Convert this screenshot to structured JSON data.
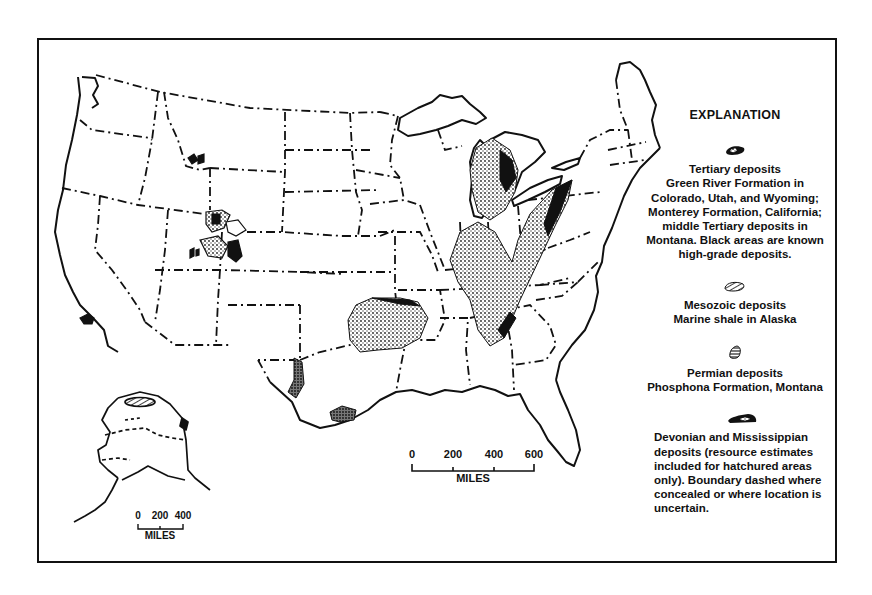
{
  "figure": {
    "type": "map"
  },
  "legend": {
    "title": "EXPLANATION",
    "items": [
      {
        "symbol": "tertiary-deposit-symbol",
        "name": "Tertiary deposits",
        "description": "Green River Formation in Colorado, Utah, and Wyoming; Monterey Formation, California; middle Tertiary deposits in Montana. Black areas are known high-grade deposits."
      },
      {
        "symbol": "mesozoic-deposit-symbol",
        "name": "Mesozoic deposits",
        "description": "Marine shale in Alaska"
      },
      {
        "symbol": "permian-deposit-symbol",
        "name": "Permian deposits",
        "description": "Phosphona Formation, Montana"
      },
      {
        "symbol": "devonian-mississippian-deposit-symbol",
        "name": "",
        "description": "Devonian and Mississippian deposits (resource estimates included for hatchured areas only). Boundary dashed where concealed or where location is uncertain."
      }
    ]
  },
  "scales": {
    "main": {
      "ticks": [
        "0",
        "200",
        "400",
        "600"
      ],
      "unit": "MILES"
    },
    "alaska": {
      "ticks": [
        "0",
        "200",
        "400"
      ],
      "unit": "MILES"
    }
  }
}
